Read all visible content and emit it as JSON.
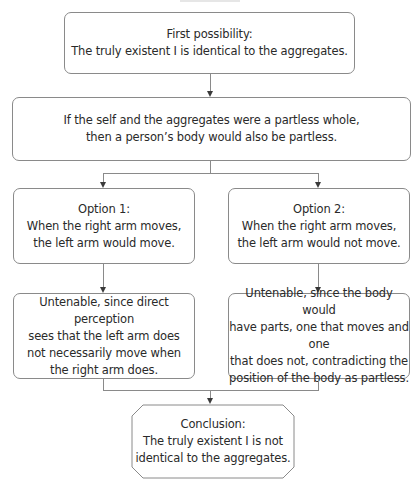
{
  "diagram": {
    "top_box": {
      "text": "First possibility:\nThe truly existent I is identical to the aggregates."
    },
    "premise_box": {
      "text": "If the self and the aggregates were a partless whole,\nthen a person’s body would also be partless."
    },
    "options": [
      {
        "text": "Option 1:\nWhen the right arm moves,\nthe left arm would move.",
        "result": "Untenable, since direct perception\nsees that the left arm does\nnot necessarily move when\nthe right arm does."
      },
      {
        "text": "Option 2:\nWhen the right arm moves,\nthe left arm would not move.",
        "result": "Untenable, since the body would\nhave parts, one that moves and one\nthat does not, contradicting the\nposition of the body as partless."
      }
    ],
    "conclusion": {
      "text": "Conclusion:\nThe truly existent I is not\nidentical to the aggregates."
    },
    "colors": {
      "border": "#8a8a8a",
      "text": "#2a2a2a",
      "arrow": "#3a3a3a",
      "background": "#ffffff"
    }
  }
}
